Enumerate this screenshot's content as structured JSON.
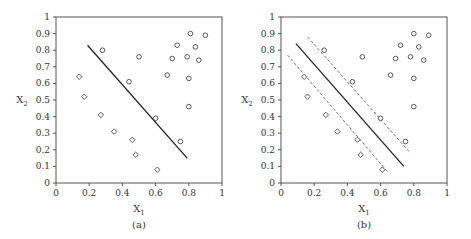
{
  "chart_data": [
    {
      "type": "scatter",
      "title": "",
      "subtitle": "(a)",
      "xlabel": "X1",
      "ylabel": "X2",
      "xlim": [
        0,
        1
      ],
      "ylim": [
        0,
        1
      ],
      "xticks": [
        "0",
        "0.2",
        "0.4",
        "0.6",
        "0.8",
        "1"
      ],
      "yticks": [
        "0",
        "0.1",
        "0.2",
        "0.3",
        "0.4",
        "0.5",
        "0.6",
        "0.7",
        "0.8",
        "0.9",
        "1"
      ],
      "grid": false,
      "legend": null,
      "series": [
        {
          "name": "circles",
          "marker": "circle",
          "points": [
            [
              0.28,
              0.8
            ],
            [
              0.5,
              0.76
            ],
            [
              0.44,
              0.61
            ],
            [
              0.6,
              0.39
            ],
            [
              0.75,
              0.25
            ],
            [
              0.67,
              0.65
            ],
            [
              0.7,
              0.75
            ],
            [
              0.73,
              0.83
            ],
            [
              0.81,
              0.9
            ],
            [
              0.79,
              0.76
            ],
            [
              0.84,
              0.82
            ],
            [
              0.86,
              0.74
            ],
            [
              0.9,
              0.89
            ],
            [
              0.8,
              0.63
            ],
            [
              0.8,
              0.46
            ]
          ]
        },
        {
          "name": "diamonds",
          "marker": "diamond",
          "points": [
            [
              0.14,
              0.64
            ],
            [
              0.17,
              0.52
            ],
            [
              0.27,
              0.41
            ],
            [
              0.35,
              0.31
            ],
            [
              0.46,
              0.26
            ],
            [
              0.48,
              0.17
            ],
            [
              0.61,
              0.08
            ]
          ]
        }
      ],
      "lines": [
        {
          "style": "solid",
          "from": [
            0.19,
            0.83
          ],
          "to": [
            0.79,
            0.15
          ]
        }
      ]
    },
    {
      "type": "scatter",
      "title": "",
      "subtitle": "(b)",
      "xlabel": "X1",
      "ylabel": "X2",
      "xlim": [
        0,
        1
      ],
      "ylim": [
        0,
        1
      ],
      "xticks": [
        "0",
        "0.2",
        "0.4",
        "0.6",
        "0.8",
        "1"
      ],
      "yticks": [
        "0",
        "0.1",
        "0.2",
        "0.3",
        "0.4",
        "0.5",
        "0.6",
        "0.7",
        "0.8",
        "0.9",
        "1"
      ],
      "grid": false,
      "legend": null,
      "series": [
        {
          "name": "circles",
          "marker": "circle",
          "points": [
            [
              0.26,
              0.8
            ],
            [
              0.49,
              0.76
            ],
            [
              0.43,
              0.61
            ],
            [
              0.6,
              0.39
            ],
            [
              0.75,
              0.25
            ],
            [
              0.66,
              0.65
            ],
            [
              0.69,
              0.75
            ],
            [
              0.72,
              0.83
            ],
            [
              0.8,
              0.9
            ],
            [
              0.78,
              0.76
            ],
            [
              0.83,
              0.82
            ],
            [
              0.86,
              0.74
            ],
            [
              0.89,
              0.89
            ],
            [
              0.8,
              0.63
            ],
            [
              0.8,
              0.46
            ]
          ]
        },
        {
          "name": "diamonds",
          "marker": "diamond",
          "points": [
            [
              0.14,
              0.64
            ],
            [
              0.16,
              0.52
            ],
            [
              0.27,
              0.41
            ],
            [
              0.34,
              0.31
            ],
            [
              0.46,
              0.26
            ],
            [
              0.48,
              0.17
            ],
            [
              0.61,
              0.08
            ]
          ]
        }
      ],
      "lines": [
        {
          "style": "solid",
          "from": [
            0.09,
            0.84
          ],
          "to": [
            0.74,
            0.1
          ]
        },
        {
          "style": "dashed",
          "from": [
            0.16,
            0.88
          ],
          "to": [
            0.78,
            0.18
          ]
        },
        {
          "style": "dashed",
          "from": [
            0.04,
            0.77
          ],
          "to": [
            0.64,
            0.07
          ]
        }
      ]
    }
  ],
  "panels": [
    {
      "id": "a",
      "origin_px": [
        56,
        183
      ],
      "size_px": 166
    },
    {
      "id": "b",
      "origin_px": [
        281,
        183
      ],
      "size_px": 166
    }
  ],
  "colors": {
    "axis": "#555555",
    "marker": "#444444",
    "line": "#222222"
  }
}
